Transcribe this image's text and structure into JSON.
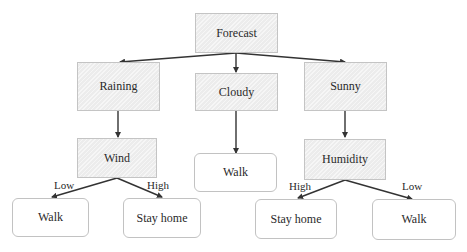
{
  "diagram": {
    "type": "decision-tree",
    "nodes": {
      "root": {
        "label": "Forecast",
        "kind": "decision"
      },
      "raining": {
        "label": "Raining",
        "kind": "decision"
      },
      "cloudy": {
        "label": "Cloudy",
        "kind": "decision"
      },
      "sunny": {
        "label": "Sunny",
        "kind": "decision"
      },
      "wind": {
        "label": "Wind",
        "kind": "decision"
      },
      "cloudy_walk": {
        "label": "Walk",
        "kind": "leaf"
      },
      "humidity": {
        "label": "Humidity",
        "kind": "decision"
      },
      "wind_low_walk": {
        "label": "Walk",
        "kind": "leaf"
      },
      "wind_high_stay": {
        "label": "Stay home",
        "kind": "leaf"
      },
      "hum_high_stay": {
        "label": "Stay home",
        "kind": "leaf"
      },
      "hum_low_walk": {
        "label": "Walk",
        "kind": "leaf"
      }
    },
    "edges": [
      {
        "from": "root",
        "to": "raining",
        "label": ""
      },
      {
        "from": "root",
        "to": "cloudy",
        "label": ""
      },
      {
        "from": "root",
        "to": "sunny",
        "label": ""
      },
      {
        "from": "raining",
        "to": "wind",
        "label": ""
      },
      {
        "from": "cloudy",
        "to": "cloudy_walk",
        "label": ""
      },
      {
        "from": "sunny",
        "to": "humidity",
        "label": ""
      },
      {
        "from": "wind",
        "to": "wind_low_walk",
        "label": "Low"
      },
      {
        "from": "wind",
        "to": "wind_high_stay",
        "label": "High"
      },
      {
        "from": "humidity",
        "to": "hum_high_stay",
        "label": "High"
      },
      {
        "from": "humidity",
        "to": "hum_low_walk",
        "label": "Low"
      }
    ],
    "edge_labels": {
      "wind_low": "Low",
      "wind_high": "High",
      "hum_high": "High",
      "hum_low": "Low"
    },
    "colors": {
      "decision_fill": "#ececec",
      "leaf_fill": "#ffffff",
      "edge": "#333333",
      "text": "#2a2a2a"
    }
  }
}
